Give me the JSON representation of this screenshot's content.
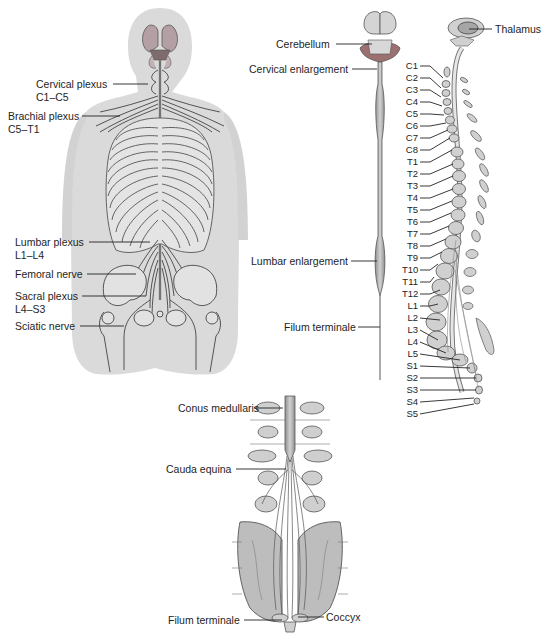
{
  "figure": {
    "panels": [
      {
        "id": "posterior-body-view",
        "description": "Posterior view of torso showing spinal nerves and plexuses"
      },
      {
        "id": "spinal-cord-isolated",
        "description": "Isolated spinal cord with brain stem"
      },
      {
        "id": "sagittal-vertebral-column",
        "description": "Lateral view of vertebral column with spinal nerve levels"
      },
      {
        "id": "cauda-equina-detail",
        "description": "Posterior view of lower spinal cord and cauda equina"
      }
    ]
  },
  "body_view": {
    "labels": [
      {
        "text": "Cervical plexus",
        "sub": "C1–C5"
      },
      {
        "text": "Brachial plexus",
        "sub": "C5–T1"
      },
      {
        "text": "Lumbar plexus",
        "sub": "L1–L4"
      },
      {
        "text": "Femoral nerve",
        "sub": ""
      },
      {
        "text": "Sacral plexus",
        "sub": "L4–S3"
      },
      {
        "text": "Sciatic nerve",
        "sub": ""
      }
    ]
  },
  "cord_view": {
    "labels": [
      {
        "text": "Cerebellum"
      },
      {
        "text": "Cervical enlargement"
      },
      {
        "text": "Lumbar enlargement"
      },
      {
        "text": "Filum terminale"
      }
    ]
  },
  "column_view": {
    "top_label": "Thalamus",
    "levels": [
      "C1",
      "C2",
      "C3",
      "C4",
      "C5",
      "C6",
      "C7",
      "C8",
      "T1",
      "T2",
      "T3",
      "T4",
      "T5",
      "T6",
      "T7",
      "T8",
      "T9",
      "T10",
      "T11",
      "T12",
      "L1",
      "L2",
      "L3",
      "L4",
      "L5",
      "S1",
      "S2",
      "S3",
      "S4",
      "S5"
    ]
  },
  "cauda_view": {
    "labels": [
      {
        "text": "Conus medullaris"
      },
      {
        "text": "Cauda equina"
      },
      {
        "text": "Filum terminale"
      },
      {
        "text": "Coccyx"
      }
    ]
  },
  "colors": {
    "body_fill": "#d9d9d9",
    "bone_fill": "#c8c8c8",
    "line": "#3a3a3a",
    "brain_fill": "#a9a9a9",
    "brain_accent": "#8a6f6f",
    "cerebellum_red": "#9c7070"
  }
}
